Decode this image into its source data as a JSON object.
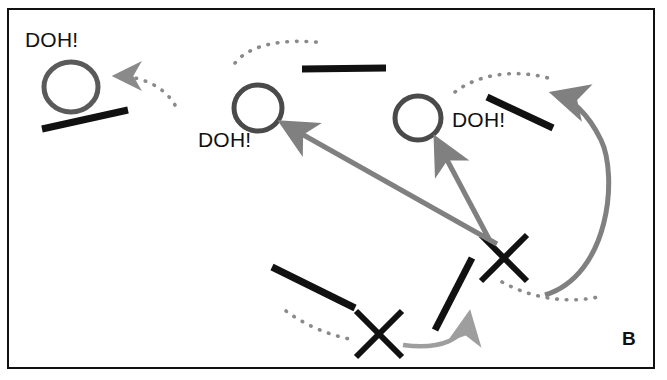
{
  "figure": {
    "panel_letter": "B",
    "background_color": "#ffffff",
    "border_color": "#111111",
    "ink_black": "#111111",
    "gray_arrow_color": "#808080",
    "light_gray_arrow_color": "#9e9e9e",
    "dotted_color": "#7a7a7a",
    "circle_color": "#5a5a5a"
  },
  "annotations": [
    {
      "id": "doh-top-left",
      "text": "DOH!",
      "x": 25,
      "y": 28
    },
    {
      "id": "doh-middle",
      "text": "DOH!",
      "x": 198,
      "y": 128
    },
    {
      "id": "doh-right",
      "text": "DOH!",
      "x": 452,
      "y": 108
    }
  ],
  "circles": [
    {
      "id": "circle-top-left",
      "cx": 71,
      "cy": 87,
      "rx": 27,
      "ry": 25
    },
    {
      "id": "circle-middle",
      "cx": 258,
      "cy": 108,
      "rx": 24,
      "ry": 23
    },
    {
      "id": "circle-right",
      "cx": 418,
      "cy": 118,
      "rx": 23,
      "ry": 22
    }
  ],
  "black_bars": [
    {
      "id": "bar-top-left",
      "x1": 42,
      "y1": 129,
      "x2": 128,
      "y2": 110
    },
    {
      "id": "bar-top-center",
      "x1": 302,
      "y1": 69,
      "x2": 386,
      "y2": 68
    },
    {
      "id": "bar-right-upper",
      "x1": 487,
      "y1": 97,
      "x2": 553,
      "y2": 128
    },
    {
      "id": "bar-lower-left",
      "x1": 272,
      "y1": 267,
      "x2": 355,
      "y2": 308
    },
    {
      "id": "bar-lower-steep",
      "x1": 472,
      "y1": 258,
      "x2": 435,
      "y2": 330
    }
  ],
  "x_marks": [
    {
      "id": "x-mark-right",
      "cx": 504,
      "cy": 258,
      "size": 23
    },
    {
      "id": "x-mark-left",
      "cx": 379,
      "cy": 334,
      "size": 23
    }
  ],
  "gray_arrows": [
    {
      "id": "arrow-to-middle-circle",
      "from_x": 497,
      "from_y": 244,
      "to_x": 277,
      "to_y": 120
    },
    {
      "id": "arrow-to-right-circle",
      "from_x": 490,
      "from_y": 240,
      "to_x": 432,
      "to_y": 137
    }
  ],
  "curved_arrows": [
    {
      "id": "curved-arrow-big-right",
      "color": "#808080",
      "target": "bar-right-upper"
    },
    {
      "id": "curved-arrow-small-bottom",
      "color": "#9e9e9e",
      "target": "bar-lower-steep"
    }
  ],
  "dotted_arcs": [
    {
      "id": "dotted-arc-top-left",
      "has_arrowhead": true,
      "arrow_to": "circle-top-left"
    },
    {
      "id": "dotted-arc-top-center",
      "has_arrowhead": false
    },
    {
      "id": "dotted-arc-right-upper",
      "has_arrowhead": false
    },
    {
      "id": "dotted-arc-bottom-right",
      "has_arrowhead": false
    },
    {
      "id": "dotted-arc-bottom-left",
      "has_arrowhead": false
    }
  ]
}
